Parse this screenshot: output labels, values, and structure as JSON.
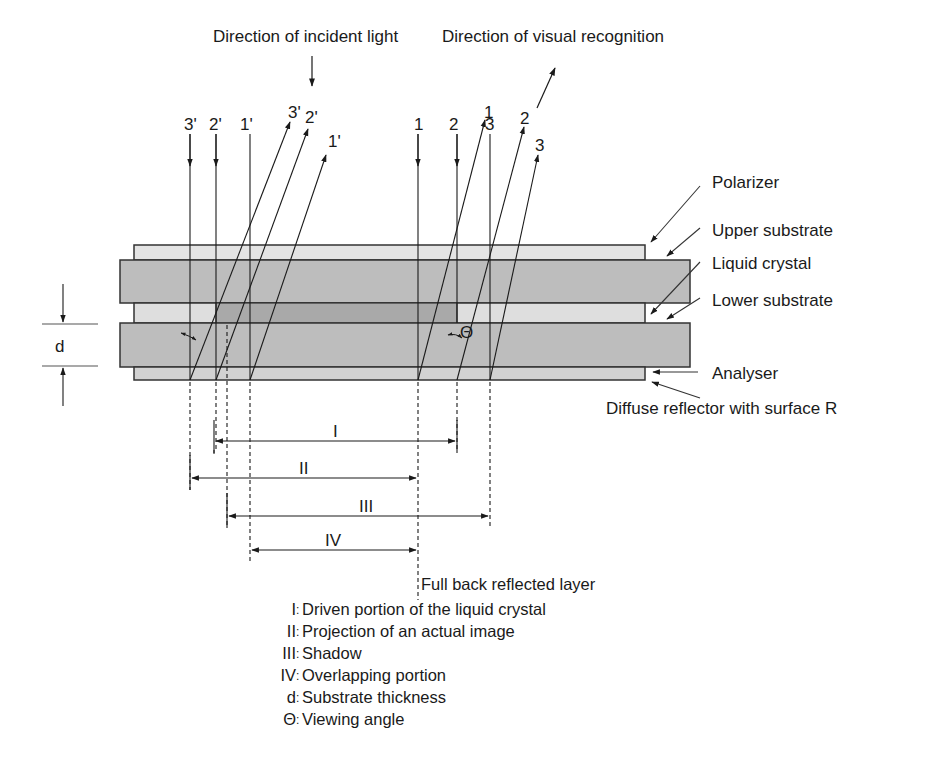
{
  "diagram": {
    "title_incident": "Direction of incident light",
    "title_visual": "Direction of visual recognition",
    "layers": [
      {
        "id": "polarizer",
        "label": "Polarizer",
        "color": "#e4e4e4"
      },
      {
        "id": "upper_substrate",
        "label": "Upper substrate",
        "color": "#bdbdbd"
      },
      {
        "id": "liquid_crystal",
        "label": "Liquid crystal",
        "color": "#dedede"
      },
      {
        "id": "lower_substrate",
        "label": "Lower substrate",
        "color": "#bdbdbd"
      },
      {
        "id": "analyser",
        "label": "Analyser",
        "color": "#d2d2d2"
      },
      {
        "id": "diffuse_reflector",
        "label": "Diffuse reflector with surface R"
      }
    ],
    "driven_portion_color": "#a9a9a9",
    "incident_rays_left": [
      "3'",
      "2'",
      "1'"
    ],
    "reflected_rays_left": [
      "3'",
      "2'",
      "1'"
    ],
    "incident_rays_right": [
      "1",
      "2",
      "3"
    ],
    "reflected_rays_right": [
      "1",
      "2",
      "3"
    ],
    "thickness_symbol": "d",
    "angle_symbol": "Θ",
    "dimensions": [
      {
        "id": "I",
        "label": "I"
      },
      {
        "id": "II",
        "label": "II"
      },
      {
        "id": "III",
        "label": "III"
      },
      {
        "id": "IV",
        "label": "IV"
      }
    ],
    "full_back_label": "Full back reflected layer"
  },
  "legend": [
    {
      "key": "I",
      "text": "Driven portion of the liquid crystal"
    },
    {
      "key": "II",
      "text": "Projection of an actual image"
    },
    {
      "key": "III",
      "text": "Shadow"
    },
    {
      "key": "IV",
      "text": "Overlapping portion"
    },
    {
      "key": "d",
      "text": "Substrate thickness"
    },
    {
      "key": "Θ",
      "text": "Viewing angle"
    }
  ]
}
